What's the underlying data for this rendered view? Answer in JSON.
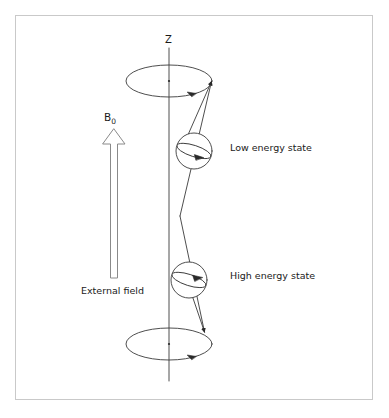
{
  "figure": {
    "background_color": "#ffffff",
    "stroke_color": "#3a3a3a",
    "text_color": "#1a1a1a",
    "border_color": "#c9c9c9"
  },
  "labels": {
    "axis_z": "Z",
    "field_symbol": "B",
    "field_subscript": "0",
    "external_field": "External field",
    "low_energy_state": "Low energy state",
    "high_energy_state": "High energy state"
  },
  "diagram_elements": {
    "vertical_axis": {
      "name": "z-axis",
      "x": 169,
      "y_top": 48,
      "y_bottom": 381
    },
    "precession_cones": [
      {
        "name": "upper-precession-ellipse",
        "center_x": 169,
        "center_y": 81,
        "radius_x": 43,
        "radius_y": 16,
        "rotation_arrow": "counterclockwise-front"
      },
      {
        "name": "lower-precession-ellipse",
        "center_x": 169,
        "center_y": 344,
        "radius_x": 43,
        "radius_y": 16,
        "rotation_arrow": "counterclockwise-front"
      }
    ],
    "spheres": [
      {
        "name": "low-energy-sphere",
        "center_x": 194,
        "center_y": 151,
        "radius": 18,
        "equator_tilt_deg": 18,
        "spin_arrow_direction": "right"
      },
      {
        "name": "high-energy-sphere",
        "center_x": 189,
        "center_y": 280,
        "radius": 18,
        "equator_tilt_deg": 18,
        "spin_arrow_direction": "right"
      }
    ],
    "magnetic_moment_vectors": [
      {
        "name": "low-energy-moment-vector",
        "from_x": 180,
        "from_y": 216,
        "to_x": 212,
        "to_y": 80,
        "arrow_at": "top",
        "points": "upward"
      },
      {
        "name": "high-energy-moment-vector",
        "from_x": 180,
        "from_y": 216,
        "to_x": 205,
        "to_y": 333,
        "arrow_at": "bottom",
        "points": "downward"
      }
    ],
    "field_arrow": {
      "name": "external-field-arrow",
      "style": "hollow-outline",
      "tip_x": 114,
      "tip_y": 129,
      "base_y": 278,
      "shaft_half_width": 3.5,
      "head_half_width": 11,
      "head_height": 15,
      "direction": "up"
    }
  }
}
